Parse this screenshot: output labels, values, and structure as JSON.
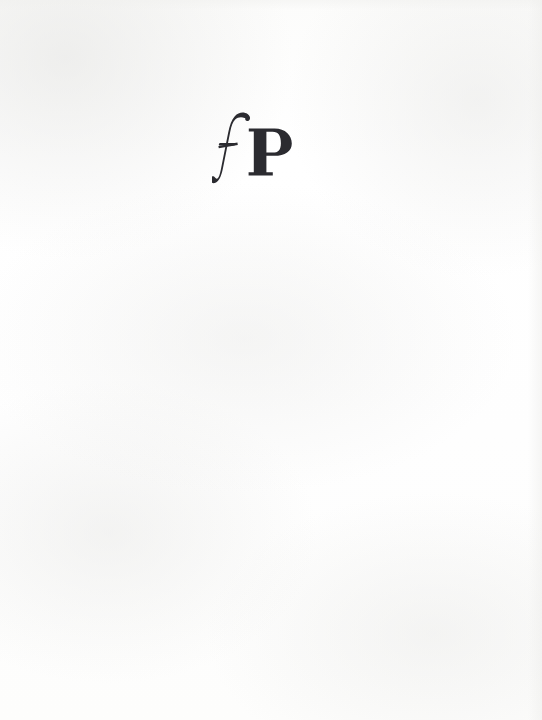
{
  "document": {
    "type": "book-page",
    "page_kind": "publisher colophon page",
    "background_color": "#fdfdfc"
  },
  "colophon": {
    "mark_text": "fP",
    "letter_f": "f",
    "letter_p": "P",
    "ink_color": "#2b2b30",
    "position": {
      "left_px": 212,
      "top_px": 110,
      "width_px": 92,
      "height_px": 80
    }
  },
  "body": {
    "content": ""
  }
}
